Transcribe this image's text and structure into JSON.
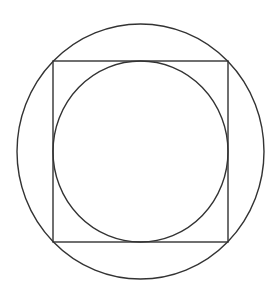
{
  "diagram": {
    "type": "geometry",
    "stroke_color": "#333333",
    "background": "#ffffff",
    "outer_circle": {
      "cx": 140.5,
      "cy": 151.5,
      "rx": 123.5,
      "ry": 127.5
    },
    "square": {
      "x": 53,
      "y": 61,
      "width": 175,
      "height": 181
    },
    "inner_circle": {
      "cx": 140.5,
      "cy": 151.5,
      "rx": 87.5,
      "ry": 90.5
    }
  }
}
